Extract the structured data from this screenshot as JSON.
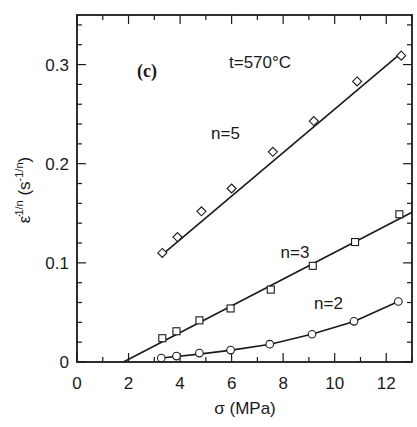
{
  "chart_data": {
    "type": "scatter",
    "title": "",
    "panel_label": "(c)",
    "annotation": "t=570°C",
    "xlabel": "σ (MPa)",
    "ylabel": "ε̇^{1/n} (s^{-1/n})",
    "xlim": [
      0,
      13
    ],
    "ylim": [
      0,
      0.35
    ],
    "xticks": [
      0,
      2,
      4,
      6,
      8,
      10,
      12
    ],
    "xtick_labels": [
      "0",
      "2",
      "4",
      "6",
      "8",
      "10",
      "12"
    ],
    "yticks": [
      0,
      0.1,
      0.2,
      0.3
    ],
    "ytick_labels": [
      "0",
      "0.1",
      "0.2",
      "0.3"
    ],
    "x_minor_step": 1,
    "y_minor_step": 0.02,
    "grid": false,
    "legend": "none (series labeled inline)",
    "series": [
      {
        "name": "n=5",
        "marker": "diamond",
        "x": [
          3.31,
          3.9,
          4.83,
          6.0,
          7.6,
          9.19,
          10.87,
          12.58
        ],
        "y": [
          0.11,
          0.126,
          0.152,
          0.175,
          0.212,
          0.243,
          0.283,
          0.309
        ],
        "fit": {
          "x": [
            3.25,
            12.6
          ],
          "y": [
            0.107,
            0.312
          ]
        },
        "label_pos": [
          5.2,
          0.225
        ]
      },
      {
        "name": "n=3",
        "marker": "square",
        "x": [
          3.31,
          3.86,
          4.75,
          5.96,
          7.52,
          9.15,
          10.79,
          12.51
        ],
        "y": [
          0.024,
          0.031,
          0.042,
          0.054,
          0.073,
          0.097,
          0.121,
          0.149
        ],
        "fit": {
          "x": [
            1.8,
            13.0
          ],
          "y": [
            0.0,
            0.151
          ]
        },
        "label_pos": [
          7.9,
          0.105
        ]
      },
      {
        "name": "n=2",
        "marker": "circle",
        "x": [
          3.27,
          3.86,
          4.75,
          5.96,
          7.48,
          9.12,
          10.75,
          12.47
        ],
        "y": [
          0.004,
          0.006,
          0.009,
          0.012,
          0.018,
          0.028,
          0.041,
          0.061
        ],
        "fit": {
          "x": [
            3.27,
            4.75,
            6.0,
            7.5,
            9.1,
            10.75,
            12.47
          ],
          "y": [
            0.004,
            0.008,
            0.012,
            0.018,
            0.028,
            0.041,
            0.061
          ]
        },
        "label_pos": [
          9.2,
          0.053
        ]
      }
    ]
  }
}
